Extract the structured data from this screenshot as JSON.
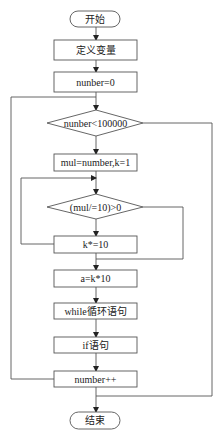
{
  "flowchart": {
    "nodes": {
      "start": {
        "type": "terminal",
        "label": "开始"
      },
      "define_vars": {
        "type": "process",
        "label": "定义变量"
      },
      "init_number": {
        "type": "process",
        "label": "nunber=0"
      },
      "outer_condition": {
        "type": "decision",
        "label": "nunber<100000"
      },
      "init_mul": {
        "type": "process",
        "label": "mul=number,k=1"
      },
      "inner_condition": {
        "type": "decision",
        "label": "(mul/=10)>0"
      },
      "k_multiply": {
        "type": "process",
        "label": "k*=10"
      },
      "compute_a": {
        "type": "process",
        "label": "a=k*10"
      },
      "while_loop": {
        "type": "process",
        "label": "while循环语句"
      },
      "if_statement": {
        "type": "process",
        "label": "if语句"
      },
      "increment": {
        "type": "process",
        "label": "number++"
      },
      "end": {
        "type": "terminal",
        "label": "结束"
      }
    },
    "edges": [
      {
        "from": "start",
        "to": "define_vars"
      },
      {
        "from": "define_vars",
        "to": "init_number"
      },
      {
        "from": "init_number",
        "to": "outer_condition"
      },
      {
        "from": "outer_condition",
        "to": "init_mul",
        "branch": "true"
      },
      {
        "from": "outer_condition",
        "to": "end",
        "branch": "false"
      },
      {
        "from": "init_mul",
        "to": "inner_condition"
      },
      {
        "from": "inner_condition",
        "to": "k_multiply",
        "branch": "true"
      },
      {
        "from": "inner_condition",
        "to": "compute_a",
        "branch": "false"
      },
      {
        "from": "k_multiply",
        "to": "inner_condition",
        "type": "loop-back"
      },
      {
        "from": "compute_a",
        "to": "while_loop"
      },
      {
        "from": "while_loop",
        "to": "if_statement"
      },
      {
        "from": "if_statement",
        "to": "increment"
      },
      {
        "from": "increment",
        "to": "outer_condition",
        "type": "loop-back"
      }
    ]
  }
}
